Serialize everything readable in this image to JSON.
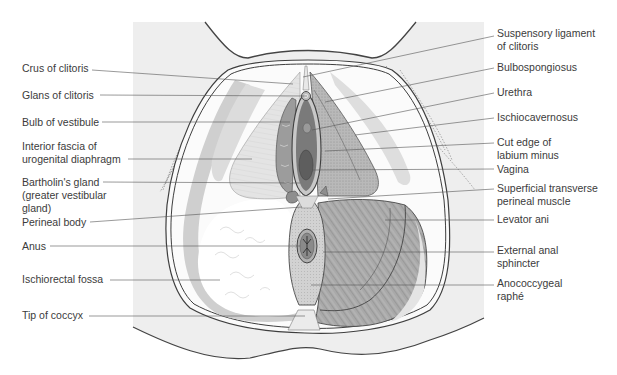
{
  "figure": {
    "colors": {
      "background_panel": "#eeeeee",
      "outline": "#4a4a4a",
      "muscle_dark": "#8c8c8c",
      "muscle_mid": "#b4b4b4",
      "fat_white": "#fafafa",
      "fascia_light": "#d8d8d8",
      "vagina_dark": "#6e6e6e",
      "leader_line": "#555555"
    }
  },
  "labels_left": [
    {
      "id": "crus-of-clitoris",
      "text": "Crus of clitoris",
      "lines": [
        "Crus of clitoris"
      ],
      "y": 68,
      "tx": 92,
      "target": [
        293,
        84
      ]
    },
    {
      "id": "glans-of-clitoris",
      "text": "Glans of clitoris",
      "lines": [
        "Glans of clitoris"
      ],
      "y": 95,
      "tx": 100,
      "target": [
        307,
        96
      ]
    },
    {
      "id": "bulb-of-vestibule",
      "text": "Bulb of vestibule",
      "lines": [
        "Bulb of vestibule"
      ],
      "y": 122,
      "tx": 102,
      "target": [
        290,
        122
      ]
    },
    {
      "id": "interior-fascia",
      "text": "Interior fascia of urogenital diaphragm",
      "lines": [
        "Interior fascia of",
        "urogenital diaphragm"
      ],
      "y": 144,
      "tx": 128,
      "target": [
        252,
        159
      ]
    },
    {
      "id": "bartholins-gland",
      "text": "Bartholin's gland (greater vestibular gland)",
      "lines": [
        "Bartholin's gland",
        "(greater vestibular",
        "gland)"
      ],
      "y": 177,
      "tx": 103,
      "target": [
        300,
        183
      ]
    },
    {
      "id": "perineal-body",
      "text": "Perineal body",
      "lines": [
        "Perineal body"
      ],
      "y": 217,
      "tx": 90,
      "target": [
        302,
        207
      ]
    },
    {
      "id": "anus",
      "text": "Anus",
      "lines": [
        "Anus"
      ],
      "y": 239,
      "tx": 50,
      "target": [
        300,
        246
      ]
    },
    {
      "id": "ischiorectal-fossa",
      "text": "Ischiorectal fossa",
      "lines": [
        "Ischiorectal fossa"
      ],
      "y": 272,
      "tx": 110,
      "target": [
        220,
        280
      ]
    },
    {
      "id": "tip-of-coccyx",
      "text": "Tip of coccyx",
      "lines": [
        "Tip of coccyx"
      ],
      "y": 308,
      "tx": 89,
      "target": [
        305,
        316
      ]
    }
  ],
  "labels_right": [
    {
      "id": "suspensory-ligament",
      "text": "Suspensory ligament of clitoris",
      "lines": [
        "Suspensory ligament",
        "of clitoris"
      ],
      "y": 28,
      "target": [
        303,
        77
      ]
    },
    {
      "id": "bulbospongiosus",
      "text": "Bulbospongiosus",
      "lines": [
        "Bulbospongiosus"
      ],
      "y": 61,
      "target": [
        325,
        102
      ]
    },
    {
      "id": "urethra",
      "text": "Urethra",
      "lines": [
        "Urethra"
      ],
      "y": 86,
      "target": [
        312,
        130
      ]
    },
    {
      "id": "ischiocavernosus",
      "text": "Ischiocavernosus",
      "lines": [
        "Ischiocavernosus"
      ],
      "y": 112,
      "target": [
        355,
        135
      ]
    },
    {
      "id": "cut-edge-labium-minus",
      "text": "Cut edge of labium minus",
      "lines": [
        "Cut edge of",
        "labium minus"
      ],
      "y": 137,
      "target": [
        325,
        151
      ]
    },
    {
      "id": "vagina",
      "text": "Vagina",
      "lines": [
        "Vagina"
      ],
      "y": 164,
      "target": [
        313,
        170
      ]
    },
    {
      "id": "superficial-transverse",
      "text": "Superficial transverse perineal muscle",
      "lines": [
        "Superficial transverse",
        "perineal muscle"
      ],
      "y": 183,
      "target": [
        328,
        199
      ]
    },
    {
      "id": "levator-ani",
      "text": "Levator ani",
      "lines": [
        "Levator ani"
      ],
      "y": 214,
      "target": [
        385,
        220
      ]
    },
    {
      "id": "external-anal-sphincter",
      "text": "External anal sphincter",
      "lines": [
        "External anal",
        "sphincter"
      ],
      "y": 241,
      "target": [
        323,
        252
      ]
    },
    {
      "id": "anococcygeal-raphe",
      "text": "Anococcygeal raphé",
      "lines": [
        "Anococcygeal",
        "raphé"
      ],
      "y": 274,
      "target": [
        311,
        285
      ]
    }
  ]
}
